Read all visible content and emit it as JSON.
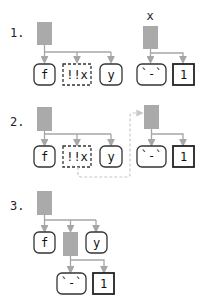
{
  "colors": {
    "call_node": "#aaaaaa",
    "edge": "#a6a6a6",
    "box_border": "#333333",
    "dashed_arrow": "#c8c8c8"
  },
  "panels": [
    {
      "step_label": "1.",
      "call_tree": {
        "children": [
          "f",
          "!!x",
          "y"
        ],
        "child_styles": [
          "rounded",
          "dashed",
          "rounded"
        ]
      },
      "separate_tree": {
        "label": "x",
        "children": [
          "`-`",
          "1"
        ],
        "child_styles": [
          "rounded",
          "square"
        ]
      }
    },
    {
      "step_label": "2.",
      "call_tree": {
        "children": [
          "f",
          "!!x",
          "y"
        ],
        "child_styles": [
          "rounded",
          "dashed",
          "rounded"
        ]
      },
      "separate_tree": {
        "label": "",
        "children": [
          "`-`",
          "1"
        ],
        "child_styles": [
          "rounded",
          "square"
        ]
      },
      "arrow": "from !!x to separate tree root (dashed)"
    },
    {
      "step_label": "3.",
      "call_tree": {
        "children": [
          "f",
          "(call)",
          "y"
        ],
        "child_styles": [
          "rounded",
          "call",
          "rounded"
        ]
      },
      "nested_tree": {
        "children": [
          "`-`",
          "1"
        ],
        "child_styles": [
          "rounded",
          "square"
        ]
      }
    }
  ]
}
